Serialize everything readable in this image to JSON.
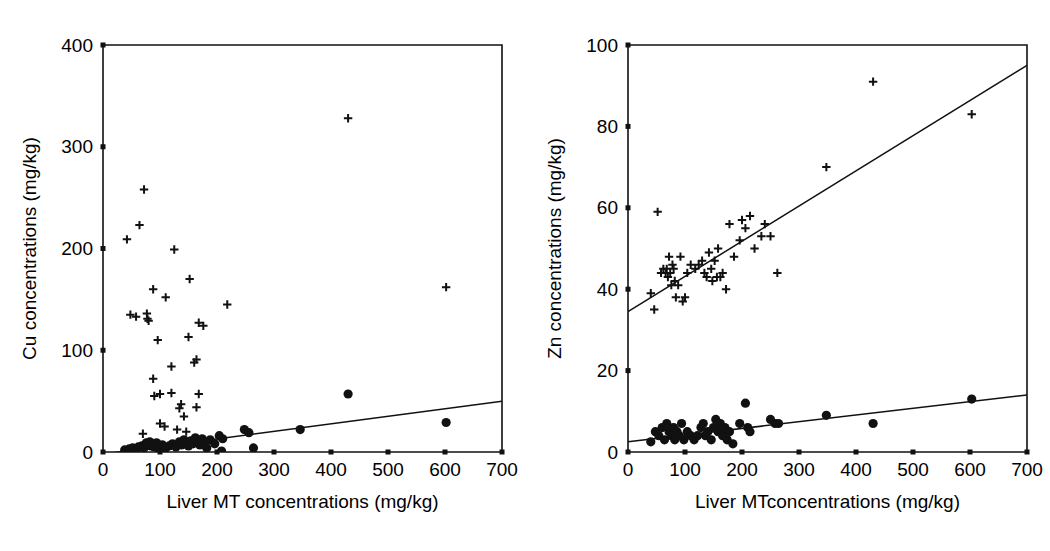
{
  "figure": {
    "panel_count": 2,
    "background_color": "#ffffff",
    "ink_color": "#111111"
  },
  "chart_data": [
    {
      "id": "cu-panel",
      "type": "scatter",
      "title": "",
      "xlabel": "Liver MT concentrations (mg/kg)",
      "ylabel": "Cu concentrations (mg/kg)",
      "xlim": [
        0,
        700
      ],
      "ylim": [
        0,
        400
      ],
      "xticks": [
        0,
        100,
        200,
        300,
        400,
        500,
        600,
        700
      ],
      "yticks": [
        0,
        100,
        200,
        300,
        400
      ],
      "xtick_labels": [
        "0",
        "100",
        "200",
        "300",
        "400",
        "500",
        "600",
        "700"
      ],
      "ytick_labels": [
        "0",
        "100",
        "200",
        "300",
        "400"
      ],
      "grid": false,
      "legend": "none",
      "series": [
        {
          "name": "plus-series",
          "marker": "plus",
          "points": [
            [
              42,
              209
            ],
            [
              64,
              223
            ],
            [
              72,
              258
            ],
            [
              125,
              199
            ],
            [
              48,
              135
            ],
            [
              58,
              133
            ],
            [
              77,
              136
            ],
            [
              78,
              131
            ],
            [
              80,
              129
            ],
            [
              88,
              160
            ],
            [
              110,
              152
            ],
            [
              96,
              110
            ],
            [
              152,
              170
            ],
            [
              150,
              113
            ],
            [
              168,
              127
            ],
            [
              176,
              124
            ],
            [
              218,
              145
            ],
            [
              430,
              328
            ],
            [
              602,
              162
            ],
            [
              120,
              84
            ],
            [
              160,
              88
            ],
            [
              164,
              91
            ],
            [
              88,
              72
            ],
            [
              100,
              57
            ],
            [
              120,
              58
            ],
            [
              168,
              57
            ],
            [
              90,
              55
            ],
            [
              137,
              47
            ],
            [
              134,
              43
            ],
            [
              164,
              44
            ],
            [
              142,
              35
            ],
            [
              100,
              28
            ],
            [
              108,
              25
            ],
            [
              130,
              22
            ],
            [
              146,
              20
            ],
            [
              70,
              18
            ]
          ]
        },
        {
          "name": "dot-series",
          "marker": "circle",
          "points": [
            [
              38,
              2
            ],
            [
              46,
              3
            ],
            [
              52,
              4
            ],
            [
              58,
              2
            ],
            [
              62,
              5
            ],
            [
              68,
              6
            ],
            [
              72,
              4
            ],
            [
              76,
              9
            ],
            [
              78,
              7
            ],
            [
              82,
              10
            ],
            [
              84,
              6
            ],
            [
              88,
              8
            ],
            [
              90,
              5
            ],
            [
              94,
              9
            ],
            [
              98,
              3
            ],
            [
              104,
              7
            ],
            [
              110,
              4
            ],
            [
              116,
              6
            ],
            [
              122,
              8
            ],
            [
              128,
              5
            ],
            [
              134,
              10
            ],
            [
              138,
              7
            ],
            [
              142,
              12
            ],
            [
              146,
              9
            ],
            [
              150,
              6
            ],
            [
              154,
              11
            ],
            [
              158,
              8
            ],
            [
              162,
              14
            ],
            [
              166,
              10
            ],
            [
              170,
              7
            ],
            [
              174,
              13
            ],
            [
              178,
              9
            ],
            [
              182,
              4
            ],
            [
              188,
              12
            ],
            [
              196,
              8
            ],
            [
              204,
              16
            ],
            [
              210,
              13
            ],
            [
              208,
              1
            ],
            [
              248,
              22
            ],
            [
              256,
              19
            ],
            [
              264,
              4
            ],
            [
              346,
              22
            ],
            [
              430,
              57
            ],
            [
              602,
              29
            ]
          ],
          "regression": {
            "x0": 0,
            "y0": -2,
            "x1": 700,
            "y1": 50
          }
        }
      ]
    },
    {
      "id": "zn-panel",
      "type": "scatter",
      "title": "",
      "xlabel": "Liver MTconcentrations (mg/kg)",
      "ylabel": "Zn concentrations (mg/kg)",
      "xlim": [
        0,
        700
      ],
      "ylim": [
        0,
        100
      ],
      "xticks": [
        0,
        100,
        200,
        300,
        400,
        500,
        600,
        700
      ],
      "yticks": [
        0,
        20,
        40,
        60,
        80,
        100
      ],
      "xtick_labels": [
        "0",
        "100",
        "200",
        "300",
        "400",
        "500",
        "600",
        "700"
      ],
      "ytick_labels": [
        "0",
        "20",
        "40",
        "60",
        "80",
        "100"
      ],
      "grid": false,
      "legend": "none",
      "series": [
        {
          "name": "plus-series",
          "marker": "plus",
          "points": [
            [
              40,
              39
            ],
            [
              46,
              35
            ],
            [
              52,
              59
            ],
            [
              58,
              44
            ],
            [
              62,
              45
            ],
            [
              66,
              44
            ],
            [
              68,
              45
            ],
            [
              70,
              43
            ],
            [
              72,
              48
            ],
            [
              74,
              44
            ],
            [
              76,
              41
            ],
            [
              78,
              46
            ],
            [
              80,
              45
            ],
            [
              82,
              42
            ],
            [
              84,
              38
            ],
            [
              88,
              41
            ],
            [
              92,
              48
            ],
            [
              96,
              37
            ],
            [
              100,
              38
            ],
            [
              104,
              44
            ],
            [
              110,
              46
            ],
            [
              118,
              45
            ],
            [
              124,
              46
            ],
            [
              130,
              47
            ],
            [
              134,
              44
            ],
            [
              138,
              43
            ],
            [
              142,
              49
            ],
            [
              146,
              45
            ],
            [
              148,
              42
            ],
            [
              152,
              47
            ],
            [
              156,
              43
            ],
            [
              158,
              50
            ],
            [
              162,
              43
            ],
            [
              166,
              44
            ],
            [
              172,
              40
            ],
            [
              178,
              56
            ],
            [
              186,
              48
            ],
            [
              196,
              52
            ],
            [
              200,
              57
            ],
            [
              206,
              55
            ],
            [
              214,
              58
            ],
            [
              222,
              50
            ],
            [
              234,
              53
            ],
            [
              240,
              56
            ],
            [
              250,
              53
            ],
            [
              262,
              44
            ],
            [
              348,
              70
            ],
            [
              430,
              91
            ],
            [
              603,
              83
            ]
          ],
          "regression": {
            "x0": 0,
            "y0": 34.5,
            "x1": 700,
            "y1": 95
          }
        },
        {
          "name": "dot-series",
          "marker": "circle",
          "points": [
            [
              40,
              2.5
            ],
            [
              48,
              5
            ],
            [
              54,
              4
            ],
            [
              60,
              6
            ],
            [
              64,
              3
            ],
            [
              68,
              7
            ],
            [
              72,
              5
            ],
            [
              76,
              4
            ],
            [
              80,
              6
            ],
            [
              82,
              3
            ],
            [
              86,
              5
            ],
            [
              90,
              4
            ],
            [
              94,
              7
            ],
            [
              98,
              3
            ],
            [
              104,
              5
            ],
            [
              110,
              4
            ],
            [
              116,
              3
            ],
            [
              122,
              4
            ],
            [
              128,
              6
            ],
            [
              132,
              7
            ],
            [
              136,
              4
            ],
            [
              140,
              5
            ],
            [
              146,
              3
            ],
            [
              150,
              6
            ],
            [
              154,
              8
            ],
            [
              158,
              5
            ],
            [
              162,
              7
            ],
            [
              166,
              4
            ],
            [
              170,
              6
            ],
            [
              174,
              3
            ],
            [
              178,
              5
            ],
            [
              184,
              2
            ],
            [
              196,
              7
            ],
            [
              206,
              12
            ],
            [
              210,
              6
            ],
            [
              214,
              5
            ],
            [
              250,
              8
            ],
            [
              258,
              7
            ],
            [
              264,
              7
            ],
            [
              348,
              9
            ],
            [
              430,
              7
            ],
            [
              603,
              13
            ]
          ],
          "regression": {
            "x0": 0,
            "y0": 2.5,
            "x1": 700,
            "y1": 14
          }
        }
      ]
    }
  ]
}
